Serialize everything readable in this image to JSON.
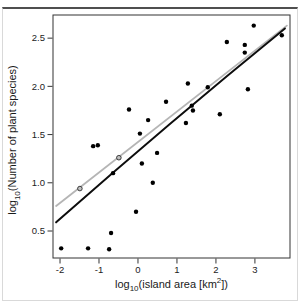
{
  "figure": {
    "background": "#ffffff",
    "frame_color": "#d9d9d9",
    "frame_top_color": "#4f4f4f"
  },
  "chart_data": {
    "type": "scatter",
    "title": "",
    "xlabel": "log10(island area [km2])",
    "ylabel": "log10(Number of plant species)",
    "xlabel_parts": {
      "p0": "log",
      "sub0": "10",
      "p1": "(island area [km",
      "sup0": "2",
      "p2": "])"
    },
    "ylabel_parts": {
      "p0": "log",
      "sub0": "10",
      "p1": "(Number of plant species)"
    },
    "xlim": [
      -2.18,
      3.9
    ],
    "ylim": [
      0.22,
      2.74
    ],
    "x_ticks": [
      -2,
      -1,
      0,
      1,
      2,
      3
    ],
    "x_tick_labels": [
      "-2",
      "-1",
      "0",
      "1",
      "2",
      "3"
    ],
    "y_ticks": [
      0.5,
      1.0,
      1.5,
      2.0,
      2.5
    ],
    "y_tick_labels": [
      "0.5",
      "1.0",
      "1.5",
      "2.0",
      "2.5"
    ],
    "grid": "off",
    "legend": "none",
    "axis_color": "#333333",
    "text_color": "#222222",
    "point_color": "#000000",
    "point_radius": 2.2,
    "points": [
      [
        -1.97,
        0.32
      ],
      [
        -1.28,
        0.32
      ],
      [
        -0.74,
        0.31
      ],
      [
        -0.69,
        0.48
      ],
      [
        -0.05,
        0.7
      ],
      [
        -1.15,
        1.38
      ],
      [
        -1.03,
        1.39
      ],
      [
        -0.64,
        1.1
      ],
      [
        0.05,
        1.51
      ],
      [
        0.26,
        1.65
      ],
      [
        -0.23,
        1.76
      ],
      [
        0.72,
        1.84
      ],
      [
        0.49,
        1.31
      ],
      [
        0.1,
        1.2
      ],
      [
        0.38,
        1.0
      ],
      [
        1.28,
        2.03
      ],
      [
        1.79,
        1.99
      ],
      [
        1.38,
        1.8
      ],
      [
        1.41,
        1.75
      ],
      [
        1.23,
        1.62
      ],
      [
        2.1,
        1.71
      ],
      [
        2.28,
        2.46
      ],
      [
        2.74,
        2.43
      ],
      [
        2.74,
        2.35
      ],
      [
        2.82,
        1.97
      ],
      [
        2.97,
        2.63
      ],
      [
        3.69,
        2.53
      ]
    ],
    "gray_points": {
      "fill": "#c0c0c0",
      "stroke": "#2a2a2a",
      "radius": 2.3,
      "points": [
        [
          -1.49,
          0.94
        ],
        [
          -0.49,
          1.26
        ]
      ]
    },
    "lines": [
      {
        "name": "linear-fit-line",
        "shape": "straight",
        "color": "#b5b5b5",
        "width": 1.8,
        "points": [
          [
            -2.1,
            0.76
          ],
          [
            3.82,
            2.63
          ]
        ]
      },
      {
        "name": "curved-fit-line",
        "shape": "quadratic",
        "color": "#0d0d0d",
        "width": 2,
        "points": [
          [
            -2.1,
            0.59
          ],
          [
            0.82,
            1.61
          ],
          [
            3.77,
            2.6
          ]
        ]
      }
    ]
  }
}
